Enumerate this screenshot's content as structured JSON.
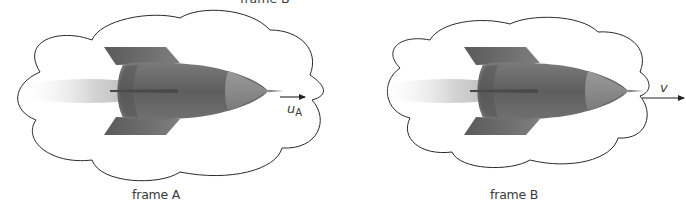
{
  "diagram": {
    "top_label": "frame B′",
    "frames": [
      {
        "label": "frame A",
        "velocity_symbol": "u",
        "velocity_subscript": "A",
        "arrow_direction": "right"
      },
      {
        "label": "frame B",
        "velocity_symbol": "v",
        "velocity_subscript": "",
        "arrow_direction": "right"
      }
    ],
    "colors": {
      "cloud_outline": "#2a2a2a",
      "rocket_body": "#6e6e6e",
      "rocket_nose": "#8a8a8a",
      "exhaust": "#cfcfcf",
      "arrow": "#222222",
      "text": "#3a3a3a"
    },
    "icons": [
      "cloud-outline",
      "rocket",
      "exhaust-plume",
      "velocity-arrow"
    ]
  }
}
